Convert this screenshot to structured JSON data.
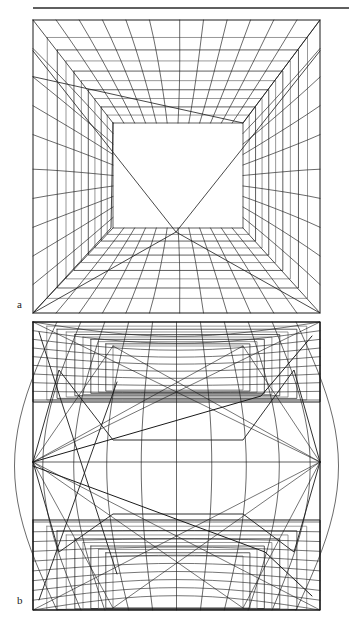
{
  "figure": {
    "type": "wireframe-perspective-grid-figure",
    "background_color": "#ffffff",
    "stroke_color": "#1a1a1a",
    "stroke_color_light": "#6b6b6b",
    "width": 349,
    "height": 619
  },
  "header_rule": {
    "name": "horizontal-rule",
    "x1": 33,
    "y1": 8,
    "x2": 349,
    "y2": 8,
    "thickness": 1.4,
    "color": "#2a2a2a"
  },
  "panels": [
    {
      "id": "a",
      "label": "a",
      "label_x": 17,
      "label_y": 299,
      "caption": "a",
      "frame": {
        "x": 33,
        "y": 20,
        "width": 287,
        "height": 293
      },
      "description": "One-point perspective box interior; nested rectangular frames receding to a central window, with curved lateral grid lines and diagonal bracing to the corners.",
      "projection": "planar-perspective",
      "vanishing_point": {
        "x": 176,
        "y": 170
      },
      "depth_steps": 10,
      "horizontal_divisions": 12,
      "vertical_divisions": 10,
      "inner_window": {
        "x": 113,
        "y": 123,
        "width": 130,
        "height": 105
      },
      "diagonal_crossing": {
        "x": 176,
        "y": 232
      },
      "corner_diagonals": true,
      "curved_laterals": true
    },
    {
      "id": "b",
      "label": "b",
      "label_x": 17,
      "label_y": 595,
      "caption": "b",
      "frame": {
        "x": 33,
        "y": 322,
        "width": 287,
        "height": 288
      },
      "description": "Two-vanishing-point barrel / hexagonal warped projection; grid bulges outward at mid-height with vanishing points pinned on the left and right frame edges, nested frames receding top and bottom.",
      "projection": "warped-cylindrical",
      "vanishing_point_left": {
        "x": 33,
        "y": 462
      },
      "vanishing_point_right": {
        "x": 320,
        "y": 462
      },
      "upper_window": {
        "x": 113,
        "y": 346,
        "width": 130,
        "height": 44
      },
      "lower_window": {
        "x": 113,
        "y": 556,
        "width": 130,
        "height": 52
      },
      "depth_steps": 9,
      "horizontal_divisions": 12,
      "vertical_divisions": 10,
      "bulge_amount": 0.17,
      "corner_diagonals": true,
      "curved_laterals": true
    }
  ],
  "chart_data": {
    "type": "line",
    "title": "",
    "xlabel": "",
    "ylabel": "",
    "grid": true,
    "legend": "none",
    "series": [
      {
        "name": "panel-a-perspective-grid",
        "note": "one-point perspective tunnel wireframe"
      },
      {
        "name": "panel-b-warped-grid",
        "note": "two-point barrel-warped wireframe"
      }
    ]
  }
}
